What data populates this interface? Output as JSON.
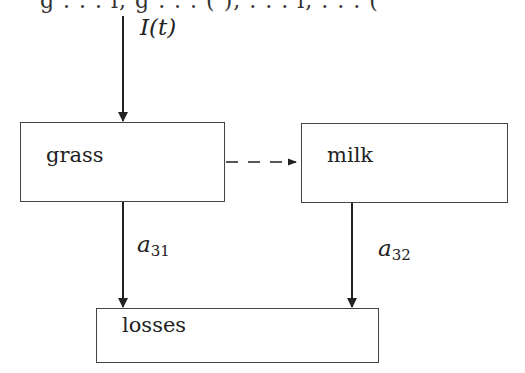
{
  "diagram": {
    "type": "compartment-flow",
    "top_clipped_text": "g  . . .  l,  g  . . .  ( ),  . . .  l,  . . .  (",
    "nodes": [
      {
        "id": "grass",
        "label": "grass"
      },
      {
        "id": "milk",
        "label": "milk"
      },
      {
        "id": "losses",
        "label": "losses"
      }
    ],
    "edges": [
      {
        "id": "input",
        "from": null,
        "to": "grass",
        "label_main": "I",
        "label_arg": "(t)",
        "style": "solid"
      },
      {
        "id": "grass-to-milk",
        "from": "grass",
        "to": "milk",
        "label": "",
        "style": "dashed"
      },
      {
        "id": "grass-to-losses",
        "from": "grass",
        "to": "losses",
        "label_main": "a",
        "label_sub": "31",
        "style": "solid"
      },
      {
        "id": "milk-to-losses",
        "from": "milk",
        "to": "losses",
        "label_main": "a",
        "label_sub": "32",
        "style": "solid"
      }
    ],
    "colors": {
      "line": "#222222",
      "box_border": "#444444",
      "background": "#ffffff"
    }
  }
}
